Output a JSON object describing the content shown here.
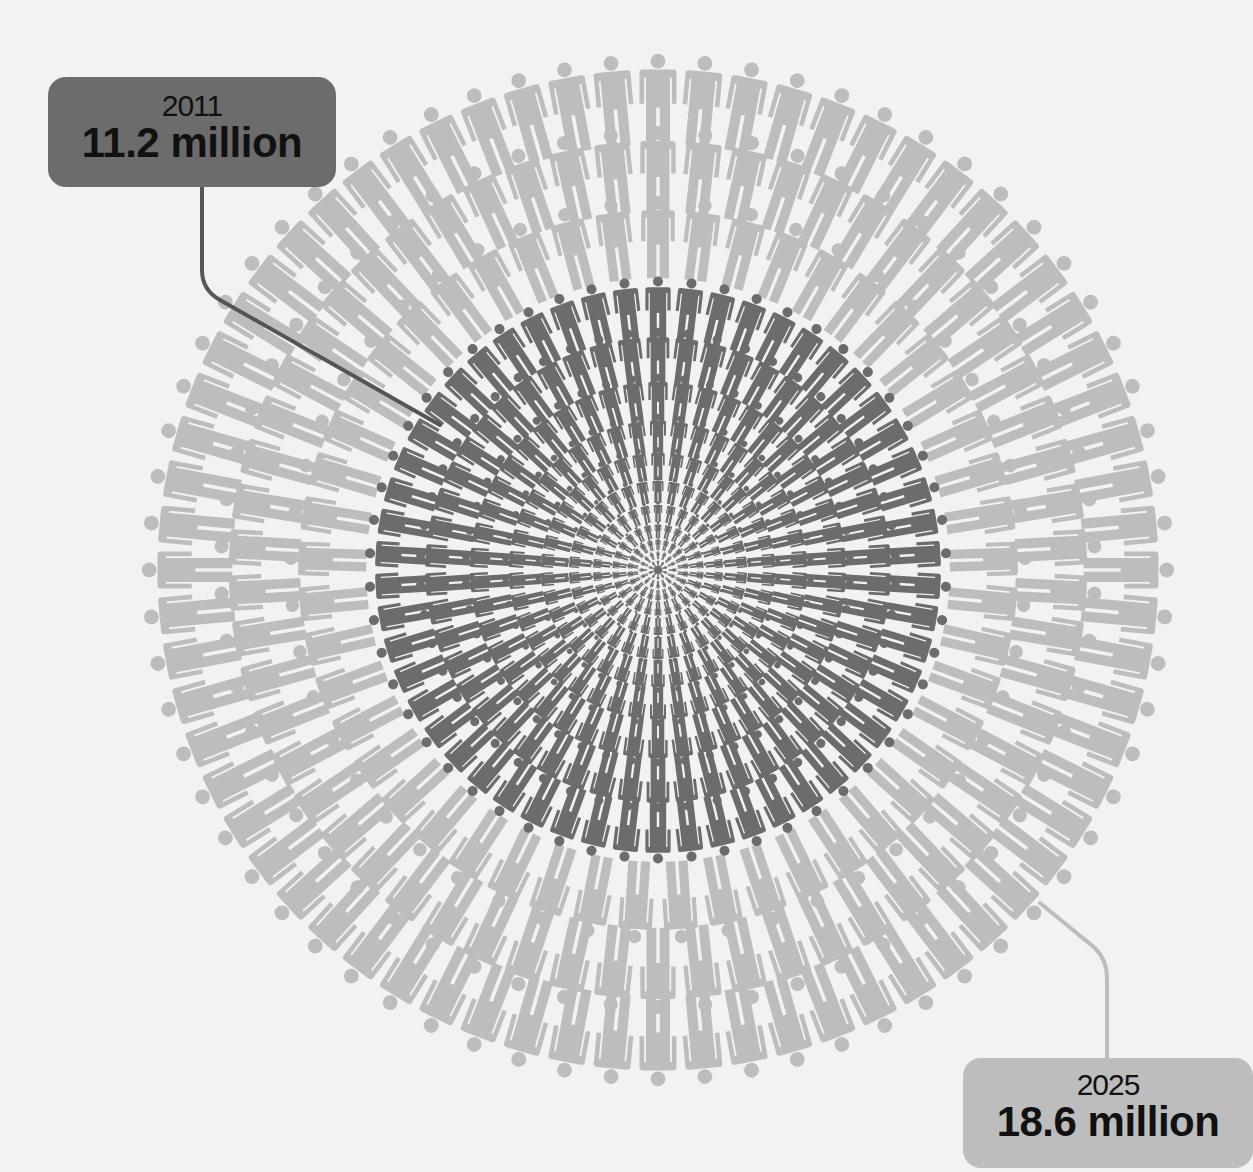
{
  "chart_data": {
    "type": "pictogram-radial",
    "title": "",
    "center": [
      658,
      570
    ],
    "series": [
      {
        "name": "2011",
        "year": "2011",
        "value_label": "11.2 million",
        "value": 11.2,
        "unit": "million",
        "color": "#6c6c6c"
      },
      {
        "name": "2025",
        "year": "2025",
        "value_label": "18.6 million",
        "value": 18.6,
        "unit": "million",
        "color": "#bdbdbd"
      }
    ],
    "rings": [
      {
        "radius": 470,
        "count": 68,
        "size": 44,
        "series": "2025"
      },
      {
        "radius": 400,
        "count": 58,
        "size": 42,
        "series": "2025"
      },
      {
        "radius": 332,
        "count": 49,
        "size": 40,
        "series": "2025"
      },
      {
        "radius": 262,
        "count": 54,
        "size": 30,
        "series": "2011"
      },
      {
        "radius": 214,
        "count": 50,
        "size": 27,
        "series": "2011"
      },
      {
        "radius": 172,
        "count": 46,
        "size": 23,
        "series": "2011"
      },
      {
        "radius": 136,
        "count": 42,
        "size": 19,
        "series": "2011"
      },
      {
        "radius": 106,
        "count": 38,
        "size": 16,
        "series": "2011"
      },
      {
        "radius": 80,
        "count": 34,
        "size": 13,
        "series": "2011"
      },
      {
        "radius": 58,
        "count": 30,
        "size": 10,
        "series": "2011"
      },
      {
        "radius": 40,
        "count": 26,
        "size": 8,
        "series": "2011"
      },
      {
        "radius": 26,
        "count": 22,
        "size": 6,
        "series": "2011"
      },
      {
        "radius": 15,
        "count": 16,
        "size": 4,
        "series": "2011"
      },
      {
        "radius": 7,
        "count": 10,
        "size": 3,
        "series": "2011"
      }
    ]
  },
  "labels": {
    "l2011": {
      "year": "2011",
      "value": "11.2 million"
    },
    "l2025": {
      "year": "2025",
      "value": "18.6 million"
    }
  },
  "colors": {
    "background": "#f2f2f2",
    "dark": "#6c6c6c",
    "light": "#bdbdbd",
    "connector_2011": "#555555",
    "connector_2025": "#bdbdbd"
  }
}
